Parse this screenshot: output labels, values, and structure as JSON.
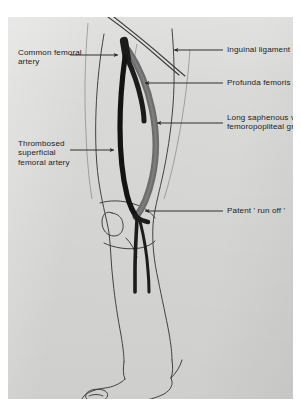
{
  "figure": {
    "kind": "anatomical-line-drawing",
    "plate_color": "#d9d9d7",
    "ink_color": "#232323"
  },
  "labels": [
    {
      "id": "common-femoral-artery",
      "text": "Common femoral\nartery",
      "side": "left"
    },
    {
      "id": "thrombosed-sfa",
      "text": "Thrombosed\nsuperficial\nfemoral artery",
      "side": "left"
    },
    {
      "id": "inguinal-ligament",
      "text": "Inguinal ligament",
      "side": "right"
    },
    {
      "id": "profunda-femoris",
      "text": "Profunda femoris artery",
      "side": "right"
    },
    {
      "id": "saphenous-graft",
      "text": "Long saphenous vein\nfemoropopliteal graft",
      "side": "right"
    },
    {
      "id": "patent-run-off",
      "text": "Patent ' run off '",
      "side": "right"
    }
  ],
  "structures": {
    "common_femoral_artery": "dark patent trunk at groin",
    "profunda_femoris_artery": "dark branch running postero-laterally",
    "thrombosed_superficial_femoral_artery": "black occluded vessel down medial thigh",
    "long_saphenous_vein_graft": "grey bypass conduit bowing laterally from groin to below knee",
    "run_off": "two patent calf branches below the knee",
    "limb_outline": "thigh, knee with patella, calf, ankle and foot in outline"
  },
  "colors": {
    "artery_dark": "#1c1c1c",
    "graft_grey": "#6d6d6d",
    "outline": "#3a3a3a",
    "leader": "#262626"
  }
}
